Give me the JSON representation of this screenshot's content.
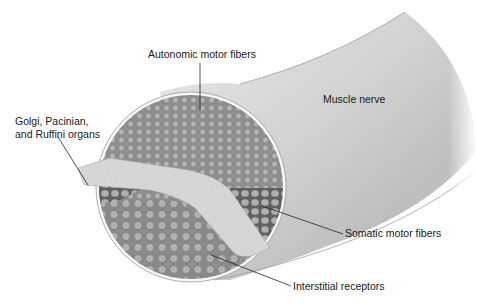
{
  "figure": {
    "type": "anatomical-diagram"
  },
  "labels": {
    "autonomic": "Autonomic motor fibers",
    "golgi_line1": "Golgi, Pacinian,",
    "golgi_line2": "and Ruffini organs",
    "muscle_nerve": "Muscle nerve",
    "somatic": "Somatic motor fibers",
    "interstitial": "Interstitial receptors"
  },
  "colors": {
    "background": "#ffffff",
    "fiber_fill": "#8c8c8c",
    "fiber_cell": "#a8a8a8",
    "sheath": "#f4f4f4",
    "nerve_light": "#f2f2f2",
    "nerve_dark": "#b4b4b4",
    "leader_line": "#222222"
  }
}
